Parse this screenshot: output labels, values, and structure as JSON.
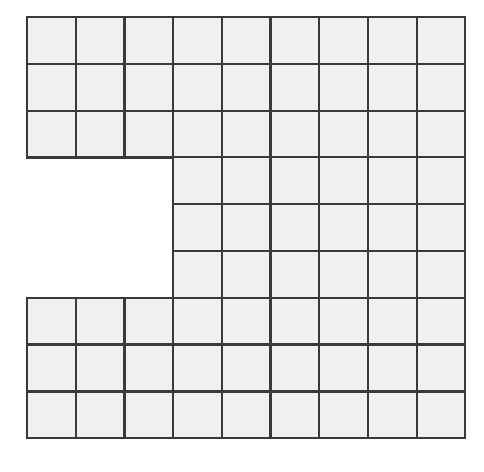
{
  "figure": {
    "kind": "grid-diagram",
    "canvas": {
      "width": 484,
      "height": 472,
      "background": "#ffffff"
    }
  },
  "chart_data": {
    "type": "heatmap",
    "xlabel": "",
    "ylabel": "",
    "grid": true,
    "legend_position": "none",
    "columns": 9,
    "rows": 9,
    "total_possible_cells": 81,
    "filled_cells": 72,
    "empty_cells": 9,
    "column_indices": [
      0,
      1,
      2,
      3,
      4,
      5,
      6,
      7,
      8
    ],
    "row_indices": [
      0,
      1,
      2,
      3,
      4,
      5,
      6,
      7,
      8
    ],
    "missing_region": {
      "columns": [
        0,
        1,
        2
      ],
      "rows": [
        3,
        4,
        5
      ],
      "width_cells": 3,
      "height_cells": 3
    },
    "occupancy": [
      [
        1,
        1,
        1,
        1,
        1,
        1,
        1,
        1,
        1
      ],
      [
        1,
        1,
        1,
        1,
        1,
        1,
        1,
        1,
        1
      ],
      [
        1,
        1,
        1,
        1,
        1,
        1,
        1,
        1,
        1
      ],
      [
        0,
        0,
        0,
        1,
        1,
        1,
        1,
        1,
        1
      ],
      [
        0,
        0,
        0,
        1,
        1,
        1,
        1,
        1,
        1
      ],
      [
        0,
        0,
        0,
        1,
        1,
        1,
        1,
        1,
        1
      ],
      [
        1,
        1,
        1,
        1,
        1,
        1,
        1,
        1,
        1
      ],
      [
        1,
        1,
        1,
        1,
        1,
        1,
        1,
        1,
        1
      ],
      [
        1,
        1,
        1,
        1,
        1,
        1,
        1,
        1,
        1
      ]
    ],
    "row_counts": [
      9,
      9,
      9,
      6,
      6,
      6,
      9,
      9,
      9
    ],
    "column_counts": [
      6,
      6,
      6,
      9,
      9,
      9,
      9,
      9,
      9
    ]
  },
  "geometry": {
    "origin_x": 27,
    "origin_y": 17,
    "cell_width": 48.7,
    "cell_height": 46.8,
    "stroke_width": 2.2
  },
  "style": {
    "cell_fill": "#f0f0f0",
    "cell_stroke": "#3a3a3a",
    "background": "#ffffff"
  }
}
